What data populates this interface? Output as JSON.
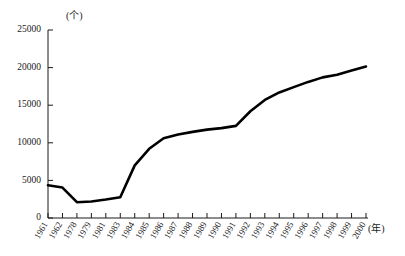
{
  "chart_data": {
    "type": "line",
    "title": "",
    "xlabel": "(年)",
    "ylabel": "(个)",
    "ylim": [
      0,
      25000
    ],
    "yticks": [
      0,
      5000,
      10000,
      15000,
      20000,
      25000
    ],
    "ytick_labels": [
      "0",
      "5000",
      "10000",
      "15000",
      "20000",
      "25000"
    ],
    "grid": false,
    "legend": "none",
    "categories": [
      "1961",
      "1962",
      "1978",
      "1979",
      "1981",
      "1983",
      "1984",
      "1985",
      "1986",
      "1987",
      "1988",
      "1989",
      "1990",
      "1991",
      "1992",
      "1993",
      "1994",
      "1995",
      "1996",
      "1997",
      "1998",
      "1999",
      "2000"
    ],
    "values": [
      4350,
      4050,
      2100,
      2200,
      2450,
      2750,
      7000,
      9200,
      10600,
      11100,
      11450,
      11750,
      11950,
      12250,
      14200,
      15700,
      16700,
      17400,
      18100,
      18700,
      19050,
      19600,
      20150
    ],
    "series": [
      {
        "name": "数量",
        "color": "#000000",
        "values": [
          4350,
          4050,
          2100,
          2200,
          2450,
          2750,
          7000,
          9200,
          10600,
          11100,
          11450,
          11750,
          11950,
          12250,
          14200,
          15700,
          16700,
          17400,
          18100,
          18700,
          19050,
          19600,
          20150
        ]
      }
    ]
  },
  "axes": {
    "y_unit": "(个)",
    "x_unit": "(年)"
  }
}
